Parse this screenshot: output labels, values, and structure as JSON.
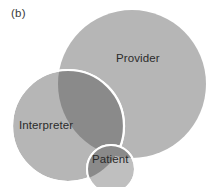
{
  "figure": {
    "panel_label": "(b)",
    "background_color": "#ffffff"
  },
  "diagram": {
    "type": "venn",
    "sets": [
      {
        "id": "provider",
        "label": "Provider",
        "fill_color": "#b6b6b6",
        "stroke_color": "none",
        "cx": 132,
        "cy": 84,
        "r": 74
      },
      {
        "id": "interpreter",
        "label": "Interpreter",
        "fill_color": "#b6b6b6",
        "stroke_color": "#ffffff",
        "cx": 68,
        "cy": 126,
        "r": 56
      },
      {
        "id": "patient",
        "label": "Patient",
        "fill_color": "#bfbfbf",
        "stroke_color": "#ffffff",
        "cx": 111,
        "cy": 169,
        "r": 24
      }
    ],
    "overlap_color": "#8a8a8a",
    "label_color": "#2b2b2b"
  }
}
